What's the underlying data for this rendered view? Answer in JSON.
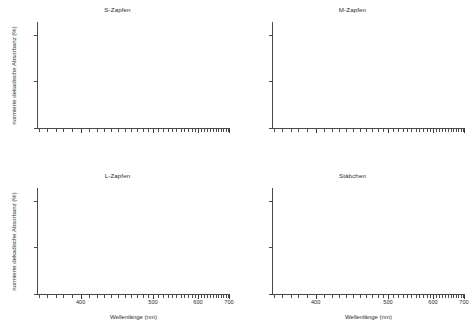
{
  "figure": {
    "layout": "2x2-grid",
    "background_color": "#ffffff",
    "axis_color": "#4a4a4a",
    "text_color": "#2e2e2e"
  },
  "axis_labels": {
    "xlabel": "Wellenlänge (nm)",
    "ylabel": "normierte dekadische Absorbanz (%)"
  },
  "xticks": {
    "labels": [
      "400",
      "500",
      "600",
      "700"
    ],
    "values": [
      400,
      500,
      600,
      700
    ],
    "positions_pct": [
      22.6,
      60.1,
      83.4,
      99.5
    ],
    "minor_positions_pct": [
      1.0,
      5.0,
      9.6,
      13.3,
      18.2,
      22.6,
      27.0,
      31.0,
      34.8,
      38.5,
      42.0,
      45.4,
      48.6,
      51.7,
      54.7,
      57.5,
      60.1,
      62.8,
      65.3,
      67.7,
      70.0,
      72.2,
      74.4,
      76.4,
      78.4,
      80.3,
      82.0,
      83.4,
      85.1,
      86.7,
      88.3,
      89.8,
      91.2,
      92.6,
      94.0,
      95.3,
      96.6,
      97.8,
      99.0,
      99.5
    ]
  },
  "yticks": {
    "labels": [
      "0",
      "50",
      "100"
    ],
    "values": [
      0,
      50,
      100
    ],
    "positions_pct": [
      0,
      43.5,
      87.0
    ]
  },
  "panels": [
    {
      "key": "s_cone",
      "title": "S-Zapfen",
      "show_ylabels": true,
      "show_xlabels": false
    },
    {
      "key": "m_cone",
      "title": "M-Zapfen",
      "show_ylabels": false,
      "show_xlabels": false
    },
    {
      "key": "l_cone",
      "title": "L-Zapfen",
      "show_ylabels": true,
      "show_xlabels": true
    },
    {
      "key": "rods",
      "title": "Stäbchen",
      "show_ylabels": false,
      "show_xlabels": true
    }
  ],
  "chart_data": {
    "type": "line",
    "title": "",
    "subplots": [
      {
        "title": "S-Zapfen",
        "xlabel": "Wellenlänge (nm)",
        "ylabel": "normierte dekadische Absorbanz (%)",
        "xlim": [
          350,
          700
        ],
        "ylim": [
          0,
          118
        ],
        "xtick_labels": [
          "400",
          "500",
          "600",
          "700"
        ],
        "ytick_labels": [
          "0",
          "50",
          "100"
        ],
        "x_scale": "wavenumber-linear",
        "grid": false,
        "legend": false,
        "series": [],
        "x": [],
        "values": [],
        "note": "no data curve rendered in this panel"
      },
      {
        "title": "M-Zapfen",
        "xlabel": "Wellenlänge (nm)",
        "ylabel": "normierte dekadische Absorbanz (%)",
        "xlim": [
          350,
          700
        ],
        "ylim": [
          0,
          118
        ],
        "xtick_labels": [
          "400",
          "500",
          "600",
          "700"
        ],
        "ytick_labels": [
          "0",
          "50",
          "100"
        ],
        "x_scale": "wavenumber-linear",
        "grid": false,
        "legend": false,
        "series": [],
        "x": [],
        "values": [],
        "note": "no data curve rendered in this panel"
      },
      {
        "title": "L-Zapfen",
        "xlabel": "Wellenlänge (nm)",
        "ylabel": "normierte dekadische Absorbanz (%)",
        "xlim": [
          350,
          700
        ],
        "ylim": [
          0,
          118
        ],
        "xtick_labels": [
          "400",
          "500",
          "600",
          "700"
        ],
        "ytick_labels": [
          "0",
          "50",
          "100"
        ],
        "x_scale": "wavenumber-linear",
        "grid": false,
        "legend": false,
        "series": [],
        "x": [],
        "values": [],
        "note": "no data curve rendered in this panel"
      },
      {
        "title": "Stäbchen",
        "xlabel": "Wellenlänge (nm)",
        "ylabel": "normierte dekadische Absorbanz (%)",
        "xlim": [
          350,
          700
        ],
        "ylim": [
          0,
          118
        ],
        "xtick_labels": [
          "400",
          "500",
          "600",
          "700"
        ],
        "ytick_labels": [
          "0",
          "50",
          "100"
        ],
        "x_scale": "wavenumber-linear",
        "grid": false,
        "legend": false,
        "series": [],
        "x": [],
        "values": [],
        "note": "no data curve rendered in this panel"
      }
    ]
  }
}
